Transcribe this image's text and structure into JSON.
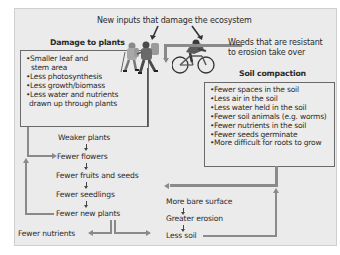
{
  "title": "New inputs that damage the ecosystem",
  "damage_to_plants": {
    "heading": "Damage to plants",
    "items": [
      "Smaller leaf and",
      "stem area",
      "Less photosynthesis",
      "Less growth/biomass",
      "Less water and nutrients",
      "drawn up through plants"
    ]
  },
  "weeds": {
    "line1": "Weeds that are resistant",
    "line2": "to erosion take over"
  },
  "soil_compaction": {
    "heading": "Soil compaction",
    "items": [
      "Fewer spaces in the soil",
      "Less air in the soil",
      "Less water held in the soil",
      "Fewer soil animals (e.g. worms)",
      "Fewer nutrients in the soil",
      "Fewer seeds germinate",
      "More difficult for roots to grow"
    ]
  },
  "plant_chain": [
    "Weaker plants",
    "Fewer flowers",
    "Fewer fruits and seeds",
    "Fewer seedlings",
    "Fewer new plants"
  ],
  "fewer_nutrients": "Fewer nutrients",
  "soil_chain": [
    "More bare surface",
    "Greater erosion",
    "Less soil"
  ],
  "illustrations": {
    "hikers": "hikers-icon",
    "cyclist": "cyclist-icon"
  },
  "colors": {
    "panel_bg": "#ebebeb",
    "arrow": "#8a8a8a",
    "box_border": "#6a6a6a",
    "text": "#2a2a2a"
  }
}
